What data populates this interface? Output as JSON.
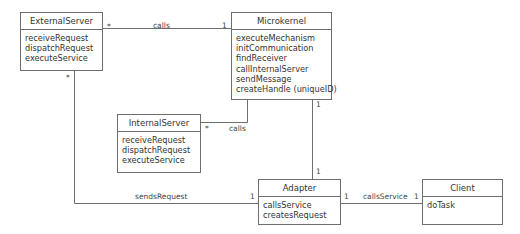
{
  "classes": {
    "external_server": {
      "name": "ExternalServer",
      "operations": [
        "receiveRequest",
        "dispatchRequest",
        "executeService"
      ]
    },
    "microkernel": {
      "name": "Microkernel",
      "operations": [
        "executeMechanism",
        "initCommunication",
        "findReceiver",
        "callInternalServer",
        "sendMessage",
        "createHandle (uniqueID)"
      ]
    },
    "internal_server": {
      "name": "InternalServer",
      "operations": [
        "receiveRequest",
        "dispatchRequest",
        "executeService"
      ]
    },
    "adapter": {
      "name": "Adapter",
      "operations": [
        "callsService",
        "createsRequest"
      ]
    },
    "client": {
      "name": "Client",
      "operations": [
        "doTask"
      ]
    }
  },
  "associations": {
    "external_to_microkernel": {
      "label": "calls",
      "source_mult": "*",
      "target_mult": "1"
    },
    "internal_to_microkernel": {
      "label": "calls",
      "source_mult": "*"
    },
    "microkernel_to_adapter": {
      "source_mult": "1",
      "target_mult": "1"
    },
    "external_to_adapter": {
      "label": "sendsRequest",
      "source_mult": "*",
      "target_mult": "1"
    },
    "adapter_to_client": {
      "label": "callsService",
      "source_mult": "1",
      "target_mult": "1"
    }
  }
}
